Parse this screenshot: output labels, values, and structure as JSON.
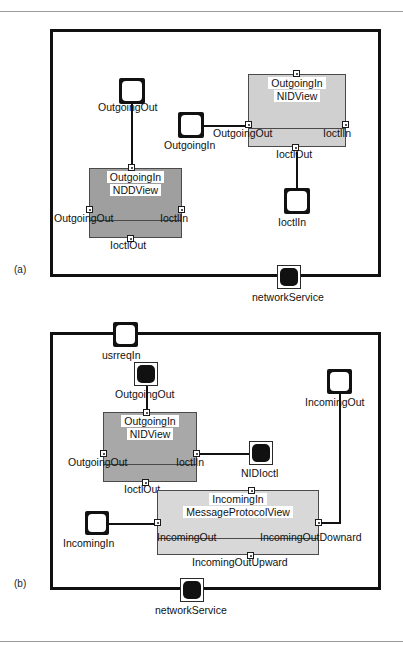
{
  "figure": {
    "panels": [
      {
        "id": "a",
        "label": "(a)"
      },
      {
        "id": "b",
        "label": "(b)"
      }
    ]
  },
  "panel_a": {
    "label": "(a)",
    "ports": [
      {
        "name": "outgoingout-top",
        "label": "OutgoingOut",
        "style": "hollow"
      },
      {
        "name": "outgoingin",
        "label": "OutgoingIn",
        "style": "hollow"
      },
      {
        "name": "ioctlin-right",
        "label": "IoctlIn",
        "style": "hollow"
      },
      {
        "name": "networkservice",
        "label": "networkService",
        "style": "filled"
      }
    ],
    "views": [
      {
        "name": "nidview",
        "title": "NIDView",
        "top_port": "OutgoingIn",
        "left_port": "OutgoingOut",
        "right_port": "IoctlIn",
        "bottom_port": "IoctlOut",
        "fill": "#d0d0d0"
      },
      {
        "name": "nddview",
        "title": "NDDView",
        "top_port": "OutgoingIn",
        "left_port": "OutgoingOut",
        "right_port": "IoctlIn",
        "bottom_port": "IoctlOut",
        "fill": "#9f9f9f"
      }
    ]
  },
  "panel_b": {
    "label": "(b)",
    "ports": [
      {
        "name": "usrreqin",
        "label": "usrreqIn",
        "style": "hollow"
      },
      {
        "name": "outgoingout",
        "label": "OutgoingOut",
        "style": "filled"
      },
      {
        "name": "incomingout",
        "label": "IncomingOut",
        "style": "hollow"
      },
      {
        "name": "nidioctl",
        "label": "NIDIoctl",
        "style": "filled"
      },
      {
        "name": "incomingin",
        "label": "IncomingIn",
        "style": "hollow"
      },
      {
        "name": "networkservice",
        "label": "networkService",
        "style": "filled"
      }
    ],
    "views": [
      {
        "name": "nidview",
        "title": "NIDView",
        "top_port": "OutgoingIn",
        "left_port": "OutgoingOut",
        "right_port": "IoctlIn",
        "bottom_port": "IoctlOut",
        "fill": "#a8a8a8"
      },
      {
        "name": "messageprotocolview",
        "title": "MessageProtocolView",
        "top_port": "IncomingIn",
        "left_port": "IncomingOut",
        "right_port": "IncomingOutDownard",
        "bottom_port": "IncomingOutUpward",
        "fill": "#d8d8d8"
      }
    ]
  },
  "colors": {
    "stroke": "#111111",
    "view_light": "#d8d8d8",
    "view_mid": "#c9c9c9",
    "view_dark": "#9f9f9f",
    "rule": "#9a9a9a"
  }
}
